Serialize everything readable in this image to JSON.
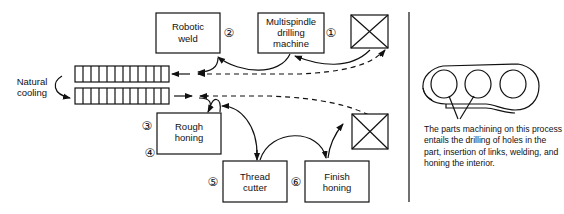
{
  "machines": [
    {
      "id": 1,
      "number": "①",
      "line1": "Multispindle",
      "line2": "drilling",
      "line3": "machine"
    },
    {
      "id": 2,
      "number": "②",
      "line1": "Robotic",
      "line2": "weld"
    },
    {
      "id": 3,
      "number": "③",
      "line1": "Rough",
      "line2": "honing"
    },
    {
      "id": 4,
      "number": "④"
    },
    {
      "id": 5,
      "number": "⑤",
      "line1": "Thread",
      "line2": "cutter"
    },
    {
      "id": 6,
      "number": "⑥",
      "line1": "Finish",
      "line2": "honing"
    }
  ],
  "cooling": {
    "line1": "Natural",
    "line2": "cooling"
  },
  "caption": "The parts machining on this process entails the drilling of holes in the part, insertion of links, welding, and honing the interior.",
  "icons": {
    "storage_top": "crossed-box-icon",
    "storage_bottom": "crossed-box-icon"
  }
}
